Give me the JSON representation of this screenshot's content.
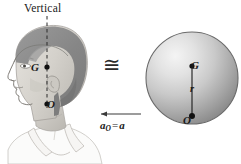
{
  "figure": {
    "title_label": "Vertical",
    "congruent_symbol": "≅",
    "head": {
      "center_of_mass_label": "G",
      "point_o_label": "O",
      "vertical_axis_label": "Vertical"
    },
    "sphere": {
      "center_label": "G",
      "radius_label": "r",
      "point_o_label": "O"
    },
    "acceleration": {
      "symbol": "a",
      "subscript": "O",
      "equals": "=",
      "value": "a",
      "full_label": "a_O = a",
      "arrow_direction": "left"
    },
    "colors": {
      "background": "#ffffff",
      "ink": "#1a1a1a",
      "hair_dark": "#8a8a8a",
      "skin_light": "#d8d5d0",
      "sphere_highlight": "#f2f2f2",
      "sphere_shadow": "#8c8c8c",
      "outline": "#555555"
    }
  }
}
